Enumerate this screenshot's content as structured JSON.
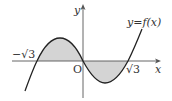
{
  "diagram": {
    "type": "function-graph",
    "function_label": "y=f(x)",
    "axes": {
      "x_label": "x",
      "y_label": "y",
      "origin_label": "O"
    },
    "roots": [
      {
        "label": "−√3",
        "value": -1.732
      },
      {
        "label": "O",
        "value": 0
      },
      {
        "label": "√3",
        "value": 1.732
      }
    ],
    "shaded_regions": [
      {
        "from": "−√3",
        "to": "0",
        "side": "above x-axis"
      },
      {
        "from": "0",
        "to": "√3",
        "side": "below x-axis"
      }
    ],
    "colors": {
      "curve": "#222222",
      "axis": "#555555",
      "shade": "#d4d4d4"
    }
  }
}
